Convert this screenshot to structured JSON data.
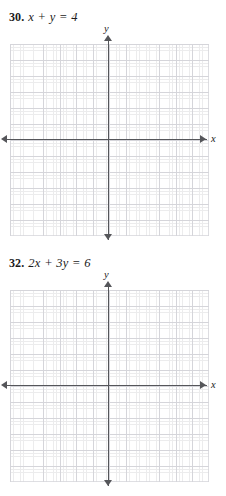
{
  "page": {
    "kind": "math-textbook-exercise-page",
    "background_color": "#ffffff",
    "grid_major_color": "#d5d5da",
    "grid_minor_color": "#ececed",
    "axis_color": "#55565a",
    "text_color": "#1b1b1b"
  },
  "problems": [
    {
      "number": "30.",
      "equation": "x + y = 4",
      "graph": {
        "x_axis_label": "x",
        "y_axis_label": "y",
        "x_arrow_left": "arrow-left-icon",
        "x_arrow_right": "arrow-right-icon",
        "y_arrow_up": "arrow-up-icon",
        "y_arrow_down": "arrow-down-icon",
        "major_columns": 12,
        "major_rows": 12,
        "minor_per_major": 5,
        "plotted_line": false
      }
    },
    {
      "number": "32.",
      "equation": "2x + 3y = 6",
      "graph": {
        "x_axis_label": "x",
        "y_axis_label": "y",
        "x_arrow_left": "arrow-left-icon",
        "x_arrow_right": "arrow-right-icon",
        "y_arrow_up": "arrow-up-icon",
        "y_arrow_down": "arrow-down-icon",
        "major_columns": 12,
        "major_rows": 12,
        "minor_per_major": 5,
        "plotted_line": false
      }
    }
  ]
}
